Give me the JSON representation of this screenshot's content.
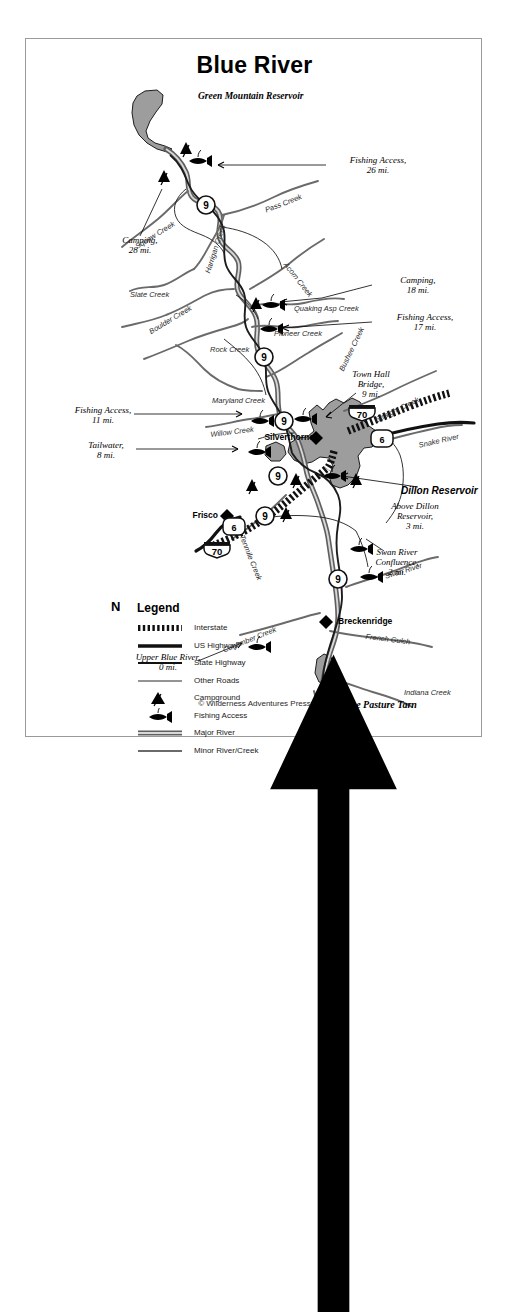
{
  "running_head": {
    "folio": "146",
    "title": "Fisherman's Guide to Colorado"
  },
  "map": {
    "title": "Blue River",
    "copyright": "© Wilderness Adventures Press",
    "water_bodies": [
      {
        "name": "Green Mountain Reservoir"
      },
      {
        "name": "Dillon Reservoir"
      },
      {
        "name": "Goose Pasture Tarn"
      }
    ],
    "towns": [
      {
        "name": "Silverthorne"
      },
      {
        "name": "Frisco"
      },
      {
        "name": "Breckenridge"
      }
    ],
    "creeks": [
      {
        "name": "Squaw Creek"
      },
      {
        "name": "Pass Creek"
      },
      {
        "name": "Slate Creek"
      },
      {
        "name": "Harrigan Creek"
      },
      {
        "name": "Acorn Creek"
      },
      {
        "name": "Boulder Creek"
      },
      {
        "name": "Quaking Asp Creek"
      },
      {
        "name": "Pioneer Creek"
      },
      {
        "name": "Rock Creek"
      },
      {
        "name": "Bushee Creek"
      },
      {
        "name": "Maryland Creek"
      },
      {
        "name": "Willow Creek"
      },
      {
        "name": "Straight Creek"
      },
      {
        "name": "Snake River"
      },
      {
        "name": "Tenmile Creek"
      },
      {
        "name": "Swan River"
      },
      {
        "name": "Cucumber Creek"
      },
      {
        "name": "French Gulch"
      },
      {
        "name": "Indiana Creek"
      }
    ],
    "callouts": [
      {
        "label": "Fishing Access,",
        "detail": "26 mi."
      },
      {
        "label": "Camping,",
        "detail": "28 mi."
      },
      {
        "label": "Camping,",
        "detail": "18 mi."
      },
      {
        "label": "Fishing Access,",
        "detail": "17 mi."
      },
      {
        "label": "Town Hall",
        "detail": "Bridge,",
        "detail2": "9 mi."
      },
      {
        "label": "Fishing Access,",
        "detail": "11 mi."
      },
      {
        "label": "Tailwater,",
        "detail": "8 mi."
      },
      {
        "label": "Above Dillon",
        "detail": "Reservoir,",
        "detail2": "3 mi."
      },
      {
        "label": "Swan River",
        "detail": "Confluence,",
        "detail2": "2 mi."
      },
      {
        "label": "Upper Blue River,",
        "detail": "0 mi."
      }
    ],
    "highways": [
      {
        "shield": "state",
        "number": "9"
      },
      {
        "shield": "state",
        "number": "9"
      },
      {
        "shield": "state",
        "number": "9"
      },
      {
        "shield": "state",
        "number": "9"
      },
      {
        "shield": "state",
        "number": "9"
      },
      {
        "shield": "state",
        "number": "9"
      },
      {
        "shield": "us",
        "number": "6"
      },
      {
        "shield": "us",
        "number": "6"
      },
      {
        "shield": "interstate",
        "number": "70"
      },
      {
        "shield": "interstate",
        "number": "70"
      }
    ]
  },
  "legend": {
    "title": "Legend",
    "compass_label": "N",
    "items": [
      {
        "key": "interstate",
        "label": "Interstate"
      },
      {
        "key": "us-highway",
        "label": "US Highway"
      },
      {
        "key": "state-highway",
        "label": "State Highway"
      },
      {
        "key": "other-roads",
        "label": "Other Roads"
      },
      {
        "key": "campground",
        "label": "Campground"
      },
      {
        "key": "fishing-access",
        "label": "Fishing Access"
      },
      {
        "key": "major-river",
        "label": "Major River"
      },
      {
        "key": "minor-river",
        "label": "Minor River/Creek"
      }
    ]
  },
  "colors": {
    "water_fill": "#9d9d9d",
    "river_stroke": "#5a5a5a",
    "road_stroke": "#1a1a1a",
    "frame": "#9a9a9a"
  }
}
